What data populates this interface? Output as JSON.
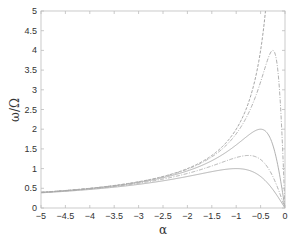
{
  "chart_data": {
    "type": "line",
    "title": "",
    "xlabel": "α",
    "ylabel": "ω/Ω",
    "xlim": [
      -5,
      0
    ],
    "ylim": [
      0,
      5
    ],
    "grid": false,
    "legend": null,
    "x_ticks": [
      -5,
      -4.5,
      -4,
      -3.5,
      -3,
      -2.5,
      -2,
      -1.5,
      -1,
      -0.5,
      0
    ],
    "x_tick_labels": [
      "-5",
      "-4.5",
      "-4",
      "-3.5",
      "-3",
      "-2.5",
      "-2",
      "-1.5",
      "-1",
      "-0.5",
      "0"
    ],
    "y_ticks": [
      0,
      0.5,
      1,
      1.5,
      2,
      2.5,
      3,
      3.5,
      4,
      4.5,
      5
    ],
    "y_tick_labels": [
      "0",
      "0.5",
      "1",
      "1.5",
      "2",
      "2.5",
      "3",
      "3.5",
      "4",
      "4.5",
      "5"
    ],
    "x": [
      -5,
      -4.5,
      -4,
      -3.5,
      -3,
      -2.5,
      -2,
      -1.75,
      -1.5,
      -1.25,
      -1,
      -0.9,
      -0.8,
      -0.75,
      -0.7,
      -0.6,
      -0.5,
      -0.4,
      -0.35,
      -0.3,
      -0.25,
      -0.2,
      -0.15,
      -0.1,
      -0.05,
      0
    ],
    "series": [
      {
        "name": "curve-unbounded",
        "color": "#9a9a9a",
        "values": [
          0.4,
          0.444,
          0.5,
          0.571,
          0.667,
          0.8,
          1.0,
          1.143,
          1.333,
          1.6,
          2.0,
          2.222,
          2.5,
          2.667,
          2.857,
          3.333,
          4.0,
          5.0,
          null,
          null,
          null,
          null,
          null,
          null,
          null,
          null
        ]
      },
      {
        "name": "curve-peak-4",
        "color": "#a8a8a8",
        "values": [
          0.399,
          0.443,
          0.498,
          0.569,
          0.662,
          0.792,
          0.985,
          1.12,
          1.297,
          1.538,
          1.882,
          2.063,
          2.278,
          2.4,
          2.534,
          2.84,
          3.2,
          3.596,
          3.784,
          3.934,
          4.0,
          3.902,
          3.529,
          2.759,
          1.538,
          0
        ]
      },
      {
        "name": "curve-peak-2",
        "color": "#a8a8a8",
        "values": [
          0.396,
          0.439,
          0.492,
          0.56,
          0.649,
          0.769,
          0.941,
          1.057,
          1.2,
          1.379,
          1.6,
          1.698,
          1.798,
          1.846,
          1.892,
          1.967,
          2.0,
          1.951,
          1.879,
          1.765,
          1.6,
          1.379,
          1.101,
          0.769,
          0.396,
          0
        ]
      },
      {
        "name": "curve-peak-1.33",
        "color": "#a8a8a8",
        "values": [
          0.391,
          0.432,
          0.483,
          0.546,
          0.627,
          0.734,
          0.877,
          0.966,
          1.067,
          1.176,
          1.28,
          1.311,
          1.331,
          1.333,
          1.33,
          1.301,
          1.231,
          1.107,
          1.022,
          0.92,
          0.8,
          0.664,
          0.513,
          0.349,
          0.177,
          0
        ]
      },
      {
        "name": "curve-peak-1",
        "color": "#a8a8a8",
        "values": [
          0.385,
          0.424,
          0.471,
          0.528,
          0.6,
          0.69,
          0.8,
          0.862,
          0.923,
          0.976,
          1.0,
          0.994,
          0.976,
          0.96,
          0.94,
          0.882,
          0.8,
          0.69,
          0.624,
          0.55,
          0.471,
          0.385,
          0.293,
          0.198,
          0.1,
          0
        ]
      }
    ]
  }
}
